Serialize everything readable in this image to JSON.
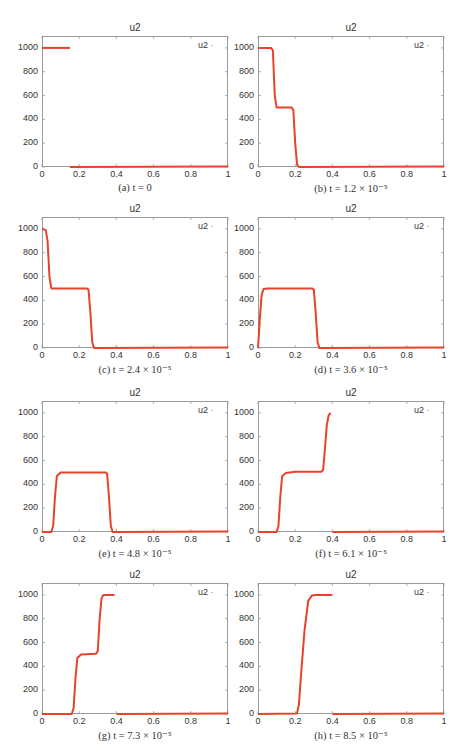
{
  "figure": {
    "panels": [
      {
        "id": "a",
        "title": "u2",
        "legend": "u2",
        "caption": "(a) t = 0"
      },
      {
        "id": "b",
        "title": "u2",
        "legend": "u2",
        "caption": "(b) t = 1.2 × 10⁻⁵"
      },
      {
        "id": "c",
        "title": "u2",
        "legend": "u2",
        "caption": "(c) t = 2.4 × 10⁻⁵"
      },
      {
        "id": "d",
        "title": "u2",
        "legend": "u2",
        "caption": "(d) t = 3.6 × 10⁻⁵"
      },
      {
        "id": "e",
        "title": "u2",
        "legend": "u2",
        "caption": "(e) t = 4.8 × 10⁻⁵"
      },
      {
        "id": "f",
        "title": "u2",
        "legend": "u2",
        "caption": "(f) t = 6.1 × 10⁻⁵"
      },
      {
        "id": "g",
        "title": "u2",
        "legend": "u2",
        "caption": "(g) t = 7.3 × 10⁻⁵"
      },
      {
        "id": "h",
        "title": "u2",
        "legend": "u2",
        "caption": "(h) t = 8.5 × 10⁻⁵"
      }
    ],
    "yticks": [
      "0",
      "200",
      "400",
      "600",
      "800",
      "1000"
    ],
    "xticks": [
      "0",
      "0.2",
      "0.4",
      "0.6",
      "0.8",
      "1"
    ],
    "line_color": "#e8432a"
  },
  "chart_data": [
    {
      "type": "line",
      "title": "u2",
      "caption": "(a) t = 0",
      "xlim": [
        0,
        1
      ],
      "ylim": [
        0,
        1100
      ],
      "series": [
        {
          "name": "u2",
          "segments": [
            [
              [
                0,
                1000
              ],
              [
                0.15,
                1000
              ]
            ],
            [
              [
                0.15,
                0
              ],
              [
                1,
                5
              ]
            ]
          ]
        }
      ]
    },
    {
      "type": "line",
      "title": "u2",
      "caption": "(b) t = 1.2 × 10⁻⁵",
      "xlim": [
        0,
        1
      ],
      "ylim": [
        0,
        1100
      ],
      "series": [
        {
          "name": "u2",
          "x": [
            0,
            0.07,
            0.08,
            0.09,
            0.1,
            0.18,
            0.19,
            0.2,
            0.21,
            0.22,
            1
          ],
          "y": [
            1000,
            1000,
            980,
            600,
            500,
            500,
            480,
            200,
            20,
            0,
            5
          ]
        }
      ]
    },
    {
      "type": "line",
      "title": "u2",
      "caption": "(c) t = 2.4 × 10⁻⁵",
      "xlim": [
        0,
        1
      ],
      "ylim": [
        0,
        1100
      ],
      "series": [
        {
          "name": "u2",
          "x": [
            0,
            0.02,
            0.03,
            0.04,
            0.05,
            0.24,
            0.25,
            0.26,
            0.27,
            0.28,
            1
          ],
          "y": [
            1000,
            990,
            900,
            600,
            500,
            500,
            490,
            300,
            50,
            0,
            5
          ]
        }
      ]
    },
    {
      "type": "line",
      "title": "u2",
      "caption": "(d) t = 3.6 × 10⁻⁵",
      "xlim": [
        0,
        1
      ],
      "ylim": [
        0,
        1100
      ],
      "series": [
        {
          "name": "u2",
          "x": [
            0,
            0.01,
            0.02,
            0.03,
            0.05,
            0.29,
            0.3,
            0.31,
            0.32,
            0.33,
            1
          ],
          "y": [
            0,
            250,
            450,
            495,
            500,
            500,
            490,
            300,
            50,
            0,
            5
          ]
        }
      ]
    },
    {
      "type": "line",
      "title": "u2",
      "caption": "(e) t = 4.8 × 10⁻⁵",
      "xlim": [
        0,
        1
      ],
      "ylim": [
        0,
        1100
      ],
      "series": [
        {
          "name": "u2",
          "x": [
            0,
            0.05,
            0.06,
            0.07,
            0.08,
            0.1,
            0.34,
            0.35,
            0.36,
            0.37,
            0.38,
            1
          ],
          "y": [
            0,
            0,
            50,
            300,
            470,
            500,
            500,
            490,
            300,
            50,
            0,
            5
          ]
        }
      ]
    },
    {
      "type": "line",
      "title": "u2",
      "caption": "(f) t = 6.1 × 10⁻⁵",
      "xlim": [
        0,
        1
      ],
      "ylim": [
        0,
        1100
      ],
      "series": [
        {
          "name": "u2",
          "segments": [
            [
              [
                0,
                0
              ],
              [
                0.1,
                0
              ],
              [
                0.11,
                50
              ],
              [
                0.12,
                300
              ],
              [
                0.13,
                470
              ],
              [
                0.15,
                495
              ],
              [
                0.2,
                505
              ],
              [
                0.34,
                505
              ],
              [
                0.35,
                520
              ],
              [
                0.36,
                700
              ],
              [
                0.37,
                900
              ],
              [
                0.38,
                980
              ],
              [
                0.39,
                1000
              ]
            ],
            [
              [
                0.4,
                0
              ],
              [
                1,
                5
              ]
            ]
          ]
        }
      ]
    },
    {
      "type": "line",
      "title": "u2",
      "caption": "(g) t = 7.3 × 10⁻⁵",
      "xlim": [
        0,
        1
      ],
      "ylim": [
        0,
        1100
      ],
      "series": [
        {
          "name": "u2",
          "segments": [
            [
              [
                0,
                0
              ],
              [
                0.16,
                0
              ],
              [
                0.17,
                50
              ],
              [
                0.18,
                300
              ],
              [
                0.19,
                470
              ],
              [
                0.21,
                500
              ],
              [
                0.29,
                505
              ],
              [
                0.3,
                530
              ],
              [
                0.31,
                800
              ],
              [
                0.32,
                970
              ],
              [
                0.33,
                1000
              ],
              [
                0.39,
                1000
              ]
            ],
            [
              [
                0.4,
                0
              ],
              [
                1,
                5
              ]
            ]
          ]
        }
      ]
    },
    {
      "type": "line",
      "title": "u2",
      "caption": "(h) t = 8.5 × 10⁻⁵",
      "xlim": [
        0,
        1
      ],
      "ylim": [
        0,
        1100
      ],
      "series": [
        {
          "name": "u2",
          "segments": [
            [
              [
                0,
                0
              ],
              [
                0.21,
                5
              ],
              [
                0.22,
                80
              ],
              [
                0.23,
                300
              ],
              [
                0.25,
                700
              ],
              [
                0.27,
                950
              ],
              [
                0.29,
                995
              ],
              [
                0.31,
                1000
              ],
              [
                0.4,
                1000
              ]
            ],
            [
              [
                0.4,
                0
              ],
              [
                1,
                5
              ]
            ]
          ]
        }
      ]
    }
  ]
}
